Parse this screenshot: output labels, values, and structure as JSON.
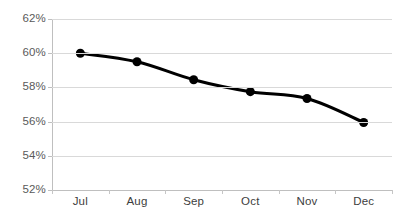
{
  "chart_data": {
    "type": "line",
    "title": "",
    "subtitle": "",
    "xlabel": "",
    "ylabel": "",
    "categories": [
      "Jul",
      "Aug",
      "Sep",
      "Oct",
      "Nov",
      "Dec"
    ],
    "series": [
      {
        "name": "",
        "values": [
          60.0,
          59.5,
          58.45,
          57.75,
          57.35,
          55.95
        ]
      }
    ],
    "ylim": [
      52,
      62
    ],
    "ytick_step": 2,
    "ytick_labels": [
      "62%",
      "60%",
      "58%",
      "56%",
      "54%",
      "52%"
    ],
    "ytick_values": [
      62,
      60,
      58,
      56,
      54,
      52
    ],
    "grid": true,
    "grid_axis": "y",
    "legend": false,
    "legend_position": "none",
    "value_format": "percent",
    "annotations": [],
    "colors": {
      "line": "#000000",
      "marker": "#000000",
      "gridline": "#d9d9d9",
      "axis": "#bfbfbf",
      "ytick_text": "#5a5a5a",
      "xtick_text": "#3d3d3d",
      "background": "#ffffff"
    },
    "style": {
      "line_width_px": 3,
      "marker_shape": "circle",
      "marker_size_px": 9
    }
  }
}
